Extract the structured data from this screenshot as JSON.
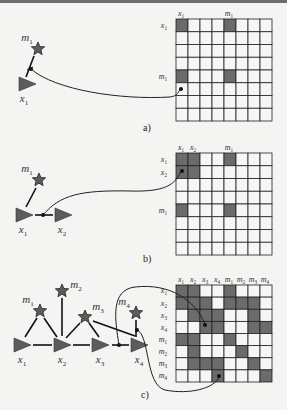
{
  "panels": [
    {
      "id": "a",
      "caption": "a)",
      "col_labels": [
        "x1",
        "",
        "",
        "",
        "m1",
        "",
        "",
        ""
      ],
      "row_labels": [
        "x1",
        "",
        "",
        "",
        "m1",
        "",
        "",
        ""
      ],
      "grid_size": 8,
      "filled": [
        [
          0,
          0
        ],
        [
          0,
          4
        ],
        [
          4,
          0
        ],
        [
          4,
          4
        ]
      ],
      "graph": {
        "poses": [
          {
            "name": "x1"
          }
        ],
        "landmarks": [
          {
            "name": "m1"
          }
        ],
        "edges": [
          [
            "x1",
            "m1"
          ]
        ]
      }
    },
    {
      "id": "b",
      "caption": "b)",
      "col_labels": [
        "x1",
        "x2",
        "",
        "",
        "m1",
        "",
        "",
        ""
      ],
      "row_labels": [
        "x1",
        "x2",
        "",
        "",
        "m1",
        "",
        "",
        ""
      ],
      "grid_size": 8,
      "filled": [
        [
          0,
          0
        ],
        [
          0,
          1
        ],
        [
          0,
          4
        ],
        [
          1,
          0
        ],
        [
          1,
          1
        ],
        [
          4,
          0
        ],
        [
          4,
          4
        ]
      ],
      "graph": {
        "poses": [
          {
            "name": "x1"
          },
          {
            "name": "x2"
          }
        ],
        "landmarks": [
          {
            "name": "m1"
          }
        ],
        "edges": [
          [
            "x1",
            "m1"
          ],
          [
            "x1",
            "x2"
          ]
        ]
      }
    },
    {
      "id": "c",
      "caption": "c)",
      "col_labels": [
        "x1",
        "x2",
        "x3",
        "x4",
        "m1",
        "m2",
        "m3",
        "m4"
      ],
      "row_labels": [
        "x1",
        "x2",
        "x3",
        "x4",
        "m1",
        "m2",
        "m3",
        "m4"
      ],
      "grid_size": 8,
      "filled": [
        [
          0,
          0
        ],
        [
          0,
          1
        ],
        [
          0,
          4
        ],
        [
          1,
          0
        ],
        [
          1,
          1
        ],
        [
          1,
          2
        ],
        [
          1,
          4
        ],
        [
          1,
          5
        ],
        [
          1,
          6
        ],
        [
          2,
          1
        ],
        [
          2,
          2
        ],
        [
          2,
          3
        ],
        [
          2,
          6
        ],
        [
          3,
          2
        ],
        [
          3,
          3
        ],
        [
          3,
          6
        ],
        [
          3,
          7
        ],
        [
          4,
          0
        ],
        [
          4,
          1
        ],
        [
          4,
          4
        ],
        [
          5,
          1
        ],
        [
          5,
          5
        ],
        [
          6,
          1
        ],
        [
          6,
          2
        ],
        [
          6,
          3
        ],
        [
          6,
          6
        ],
        [
          7,
          3
        ],
        [
          7,
          7
        ]
      ],
      "graph": {
        "poses": [
          {
            "name": "x1"
          },
          {
            "name": "x2"
          },
          {
            "name": "x3"
          },
          {
            "name": "x4"
          }
        ],
        "landmarks": [
          {
            "name": "m1"
          },
          {
            "name": "m2"
          },
          {
            "name": "m3"
          },
          {
            "name": "m4"
          }
        ],
        "edges": [
          [
            "x1",
            "m1"
          ],
          [
            "x2",
            "m1"
          ],
          [
            "x2",
            "m2"
          ],
          [
            "x2",
            "m3"
          ],
          [
            "x3",
            "m3"
          ],
          [
            "x4",
            "m3"
          ],
          [
            "x4",
            "m4"
          ],
          [
            "x1",
            "x2"
          ],
          [
            "x2",
            "x3"
          ],
          [
            "x3",
            "x4"
          ]
        ]
      }
    }
  ],
  "colors": {
    "filled_cell": "#6b6b6b",
    "empty_cell": "#f6f6f4",
    "grid_line": "#222222",
    "node_fill": "#5c5c5c"
  }
}
